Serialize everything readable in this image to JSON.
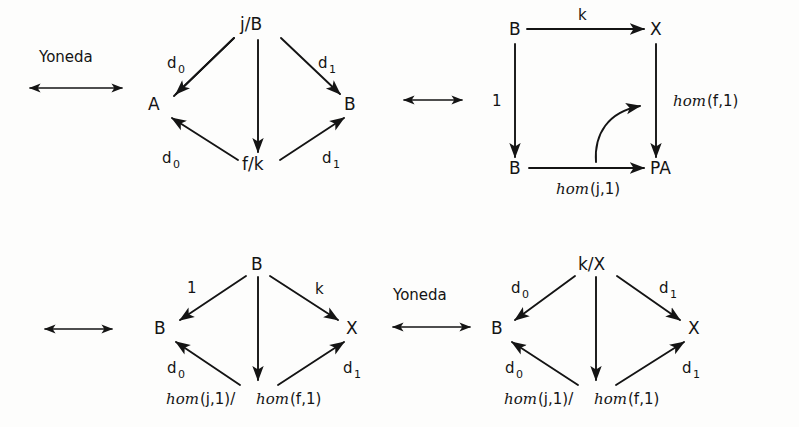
{
  "figure": {
    "background_color": "#fdfdfc",
    "ink_color": "#141414"
  },
  "connectors": [
    {
      "id": "connector-top-left",
      "label": "Yoneda",
      "kind": "double-headed-arrow",
      "direction": "both"
    },
    {
      "id": "connector-top-middle",
      "label": "",
      "kind": "double-headed-arrow",
      "direction": "both"
    },
    {
      "id": "connector-bottom-left",
      "label": "",
      "kind": "double-headed-arrow",
      "direction": "both"
    },
    {
      "id": "connector-bottom-middle",
      "label": "Yoneda",
      "kind": "double-headed-arrow",
      "direction": "both"
    }
  ],
  "diagrams": [
    {
      "id": "diagram-top-left",
      "shape": "diamond",
      "nodes": [
        {
          "id": "tl-top",
          "label": "j/B"
        },
        {
          "id": "tl-left",
          "label": "A"
        },
        {
          "id": "tl-right",
          "label": "B"
        },
        {
          "id": "tl-bottom",
          "label": "f/k"
        }
      ],
      "edges": [
        {
          "from": "tl-top",
          "to": "tl-left",
          "label": "d",
          "sub": "0"
        },
        {
          "from": "tl-top",
          "to": "tl-right",
          "label": "d",
          "sub": "1"
        },
        {
          "from": "tl-top",
          "to": "tl-bottom",
          "label": "",
          "sub": ""
        },
        {
          "from": "tl-bottom",
          "to": "tl-left",
          "label": "d",
          "sub": "0"
        },
        {
          "from": "tl-bottom",
          "to": "tl-right",
          "label": "d",
          "sub": "1"
        }
      ]
    },
    {
      "id": "diagram-top-right",
      "shape": "square",
      "nodes": [
        {
          "id": "tr-topleft",
          "label": "B"
        },
        {
          "id": "tr-topright",
          "label": "X"
        },
        {
          "id": "tr-bottomleft",
          "label": "B"
        },
        {
          "id": "tr-bottomright",
          "label": "PA"
        }
      ],
      "edges": [
        {
          "from": "tr-topleft",
          "to": "tr-topright",
          "label": "k",
          "sub": ""
        },
        {
          "from": "tr-topleft",
          "to": "tr-bottomleft",
          "label": "1",
          "sub": ""
        },
        {
          "from": "tr-topright",
          "to": "tr-bottomright",
          "label_italic": "hom",
          "label_upright": "(f,1)"
        },
        {
          "from": "tr-bottomleft",
          "to": "tr-bottomright",
          "label_italic": "hom",
          "label_upright": "(j,1)"
        },
        {
          "from": "tr-curve-start",
          "to": "tr-curve-end",
          "label": "",
          "sub": "",
          "kind": "curved-2-cell"
        }
      ]
    },
    {
      "id": "diagram-bottom-left",
      "shape": "diamond",
      "nodes": [
        {
          "id": "bl-top",
          "label": "B"
        },
        {
          "id": "bl-left",
          "label": "B"
        },
        {
          "id": "bl-right",
          "label": "X"
        },
        {
          "id": "bl-bottom",
          "label_italic_1": "hom",
          "label_upright_1": "(j,1)/",
          "label_italic_2": "hom",
          "label_upright_2": "(f,1)"
        }
      ],
      "edges": [
        {
          "from": "bl-top",
          "to": "bl-left",
          "label": "1",
          "sub": ""
        },
        {
          "from": "bl-top",
          "to": "bl-right",
          "label": "k",
          "sub": ""
        },
        {
          "from": "bl-top",
          "to": "bl-bottom",
          "label": "",
          "sub": ""
        },
        {
          "from": "bl-bottom",
          "to": "bl-left",
          "label": "d",
          "sub": "0"
        },
        {
          "from": "bl-bottom",
          "to": "bl-right",
          "label": "d",
          "sub": "1"
        }
      ]
    },
    {
      "id": "diagram-bottom-right",
      "shape": "diamond",
      "nodes": [
        {
          "id": "br-top",
          "label": "k/X"
        },
        {
          "id": "br-left",
          "label": "B"
        },
        {
          "id": "br-right",
          "label": "X"
        },
        {
          "id": "br-bottom",
          "label_italic_1": "hom",
          "label_upright_1": "(j,1)/",
          "label_italic_2": "hom",
          "label_upright_2": "(f,1)"
        }
      ],
      "edges": [
        {
          "from": "br-top",
          "to": "br-left",
          "label": "d",
          "sub": "0"
        },
        {
          "from": "br-top",
          "to": "br-right",
          "label": "d",
          "sub": "1"
        },
        {
          "from": "br-top",
          "to": "br-bottom",
          "label": "",
          "sub": ""
        },
        {
          "from": "br-bottom",
          "to": "br-left",
          "label": "d",
          "sub": "0"
        },
        {
          "from": "br-bottom",
          "to": "br-right",
          "label": "d",
          "sub": "1"
        }
      ]
    }
  ],
  "text": {
    "yoneda_top": "Yoneda",
    "yoneda_bottom": "Yoneda",
    "tl_top": "j/B",
    "tl_left": "A",
    "tl_right": "B",
    "tl_bottom": "f/k",
    "tl_d0_upper": "d",
    "tl_d0_upper_sub": "0",
    "tl_d1_upper": "d",
    "tl_d1_upper_sub": "1",
    "tl_d0_lower": "d",
    "tl_d0_lower_sub": "0",
    "tl_d1_lower": "d",
    "tl_d1_lower_sub": "1",
    "tr_topleft": "B",
    "tr_topright": "X",
    "tr_bottomleft": "B",
    "tr_bottomright": "PA",
    "tr_k": "k",
    "tr_one": "1",
    "tr_homf_italic": "hom",
    "tr_homf_upright": "(f,1)",
    "tr_homj_italic": "hom",
    "tr_homj_upright": "(j,1)",
    "bl_top": "B",
    "bl_left": "B",
    "bl_right": "X",
    "bl_one": "1",
    "bl_k": "k",
    "bl_d0": "d",
    "bl_d0_sub": "0",
    "bl_d1": "d",
    "bl_d1_sub": "1",
    "bl_hom1_italic": "hom",
    "bl_hom1_upright": "(j,1)/",
    "bl_hom2_italic": "hom",
    "bl_hom2_upright": "(f,1)",
    "br_top": "k/X",
    "br_left": "B",
    "br_right": "X",
    "br_d0_upper": "d",
    "br_d0_upper_sub": "0",
    "br_d1_upper": "d",
    "br_d1_upper_sub": "1",
    "br_d0_lower": "d",
    "br_d0_lower_sub": "0",
    "br_d1_lower": "d",
    "br_d1_lower_sub": "1",
    "br_hom1_italic": "hom",
    "br_hom1_upright": "(j,1)/",
    "br_hom2_italic": "hom",
    "br_hom2_upright": "(f,1)"
  }
}
